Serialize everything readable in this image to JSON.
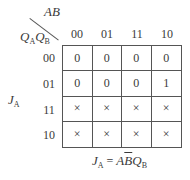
{
  "kmap": {
    "col_var": "AB",
    "row_var_1": "Q",
    "row_var_1_sub": "A",
    "row_var_2": "Q",
    "row_var_2_sub": "B",
    "func_label": "J",
    "func_label_sub": "A",
    "col_headers": [
      "00",
      "01",
      "11",
      "10"
    ],
    "row_headers": [
      "00",
      "01",
      "11",
      "10"
    ],
    "cells": [
      [
        "0",
        "0",
        "0",
        "0"
      ],
      [
        "0",
        "0",
        "0",
        "1"
      ],
      [
        "×",
        "×",
        "×",
        "×"
      ],
      [
        "×",
        "×",
        "×",
        "×"
      ]
    ],
    "equation": {
      "lhs": "J",
      "lhs_sub": "A",
      "eq": "=",
      "term_a": "A",
      "term_b_bar": "B",
      "term_q": "Q",
      "term_q_sub": "B"
    }
  }
}
